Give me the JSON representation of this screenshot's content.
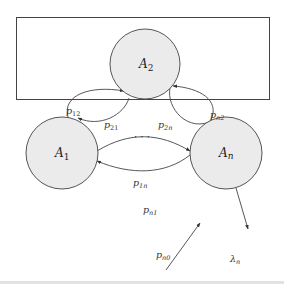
{
  "diagram": {
    "type": "state-transition",
    "nodes": [
      {
        "id": "A2",
        "label": "A",
        "subscript": "2",
        "fill": "#ebebeb"
      },
      {
        "id": "A1",
        "label": "A",
        "subscript": "1",
        "fill": "#ebebeb"
      },
      {
        "id": "An",
        "label": "A",
        "subscript": "n",
        "fill": "#ebebeb"
      }
    ],
    "edges": [
      {
        "from": "A1",
        "to": "A2",
        "label": "p",
        "subscript": "12"
      },
      {
        "from": "A2",
        "to": "A1",
        "label": "p",
        "subscript": "21"
      },
      {
        "from": "An",
        "to": "A2",
        "label": "p",
        "subscript": "n2"
      },
      {
        "from": "A2",
        "to": "An",
        "label": "p",
        "subscript": "2n"
      },
      {
        "from": "A1",
        "to": "An",
        "label": "p",
        "subscript": "1n"
      },
      {
        "from": "An",
        "to": "A1",
        "label": "p",
        "subscript": "n1"
      },
      {
        "from": "external",
        "to": "An",
        "label": "p",
        "subscript": "n0"
      },
      {
        "from": "An",
        "to": "external",
        "label": "λ",
        "subscript": "n"
      }
    ],
    "ellipsis": "· · ·",
    "colors": {
      "node_fill": "#ebebeb",
      "stroke": "#444444",
      "background": "#ffffff"
    }
  }
}
